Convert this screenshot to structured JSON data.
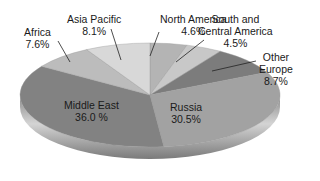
{
  "chart_data": {
    "type": "pie",
    "style": "3d-tilted",
    "title": "",
    "unit": "%",
    "start_angle_deg": 0,
    "direction": "clockwise",
    "categories": [
      "North America",
      "South and Central America",
      "Other Europe",
      "Russia",
      "Middle East",
      "Africa",
      "Asia Pacific"
    ],
    "values": [
      4.6,
      4.5,
      8.7,
      30.5,
      36.0,
      7.6,
      8.1
    ],
    "value_labels": [
      "4.6%",
      "4.5%",
      "8.7%",
      "30.5%",
      "36.0 %",
      "7.6%",
      "8.1%"
    ],
    "colors": [
      "#b4b4b4",
      "#c8c8c8",
      "#7c7c7c",
      "#a2a2a2",
      "#828282",
      "#bcbcbc",
      "#d8d8d8"
    ],
    "legend": "none",
    "labels_inside": [
      "Russia",
      "Middle East"
    ],
    "labels_outside_with_leader": [
      "North America",
      "South and Central America",
      "Other Europe",
      "Africa",
      "Asia Pacific"
    ]
  },
  "labels": {
    "north_america": {
      "name": "North America",
      "value": "4.6%"
    },
    "south_central_america": {
      "name1": "South and",
      "name2": "Central America",
      "value": "4.5%"
    },
    "other_europe": {
      "name1": "Other",
      "name2": "Europe",
      "value": "8.7%"
    },
    "russia": {
      "name": "Russia",
      "value": "30.5%"
    },
    "middle_east": {
      "name": "Middle East",
      "value": "36.0 %"
    },
    "africa": {
      "name": "Africa",
      "value": "7.6%"
    },
    "asia_pacific": {
      "name": "Asia Pacific",
      "value": "8.1%"
    }
  }
}
